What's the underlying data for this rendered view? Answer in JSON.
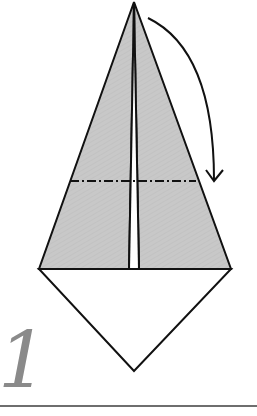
{
  "diagram": {
    "type": "origami-step",
    "step_number": "1",
    "colors": {
      "paper_back": "#c8c8c8",
      "paper_front": "#ffffff",
      "outline": "#111111",
      "step_number": "#8a8a8a",
      "rule": "#6e6e6e"
    },
    "elements": [
      {
        "name": "kite-flap-left",
        "kind": "shaded-polygon"
      },
      {
        "name": "kite-flap-right",
        "kind": "shaded-polygon"
      },
      {
        "name": "bottom-triangle",
        "kind": "white-polygon"
      },
      {
        "name": "valley-mountain-fold-line",
        "kind": "dash-dot-line"
      },
      {
        "name": "fold-down-arrow",
        "kind": "curved-arrow"
      }
    ]
  }
}
